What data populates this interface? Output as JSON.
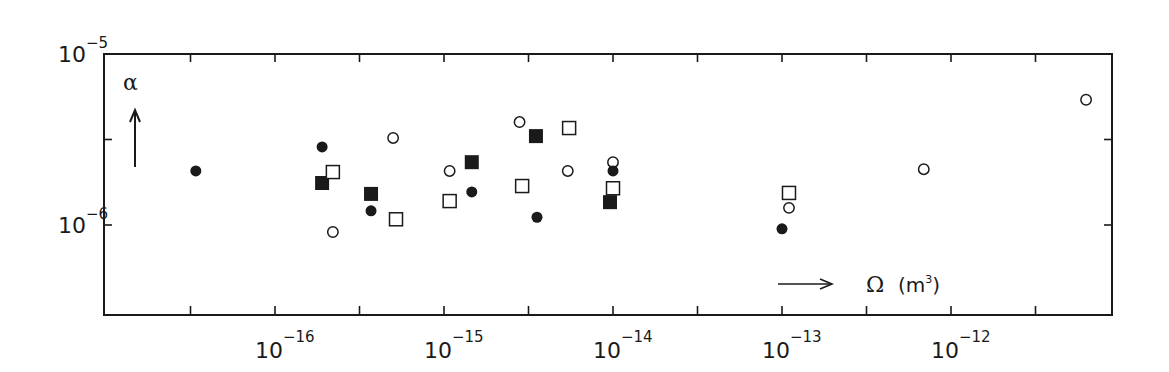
{
  "chart_data": {
    "type": "scatter",
    "title": "",
    "xlabel": "Ω (m³)",
    "ylabel": "α",
    "xscale": "log",
    "yscale": "log",
    "xlim": [
      1e-17,
      3.16e-11
    ],
    "ylim": [
      2.95e-07,
      1e-05
    ],
    "x_ticks": [
      {
        "exp": "-16",
        "value": 1e-16
      },
      {
        "exp": "-15",
        "value": 1e-15
      },
      {
        "exp": "-14",
        "value": 1e-14
      },
      {
        "exp": "-13",
        "value": 1e-13
      },
      {
        "exp": "-12",
        "value": 1e-12
      }
    ],
    "y_ticks": [
      {
        "exp": "-5",
        "value": 1e-05
      },
      {
        "exp": "-6",
        "value": 1e-06
      }
    ],
    "grid": false,
    "legend": null,
    "series": [
      {
        "name": "filled circles",
        "marker": "filled-circle",
        "points": [
          {
            "x": 3.4e-17,
            "y": 2.07e-06
          },
          {
            "x": 1.9e-16,
            "y": 2.86e-06
          },
          {
            "x": 3.7e-16,
            "y": 1.21e-06
          },
          {
            "x": 1.46e-15,
            "y": 1.56e-06
          },
          {
            "x": 3.55e-15,
            "y": 1.11e-06
          },
          {
            "x": 1e-14,
            "y": 2.07e-06
          },
          {
            "x": 1e-13,
            "y": 9.5e-07
          }
        ]
      },
      {
        "name": "open circles",
        "marker": "open-circle",
        "points": [
          {
            "x": 2.2e-16,
            "y": 9.1e-07
          },
          {
            "x": 5e-16,
            "y": 3.23e-06
          },
          {
            "x": 1.08e-15,
            "y": 2.07e-06
          },
          {
            "x": 2.8e-15,
            "y": 4e-06
          },
          {
            "x": 5.4e-15,
            "y": 2.07e-06
          },
          {
            "x": 1e-14,
            "y": 2.33e-06
          },
          {
            "x": 1.1e-13,
            "y": 1.26e-06
          },
          {
            "x": 6.9e-13,
            "y": 2.12e-06
          },
          {
            "x": 6.3e-12,
            "y": 5.4e-06
          }
        ]
      },
      {
        "name": "filled squares",
        "marker": "filled-square",
        "points": [
          {
            "x": 1.9e-16,
            "y": 1.76e-06
          },
          {
            "x": 3.7e-16,
            "y": 1.52e-06
          },
          {
            "x": 1.46e-15,
            "y": 2.33e-06
          },
          {
            "x": 3.5e-15,
            "y": 3.31e-06
          },
          {
            "x": 9.6e-15,
            "y": 1.36e-06
          }
        ]
      },
      {
        "name": "open squares",
        "marker": "open-square",
        "points": [
          {
            "x": 2.2e-16,
            "y": 2.04e-06
          },
          {
            "x": 5.2e-16,
            "y": 1.08e-06
          },
          {
            "x": 1.08e-15,
            "y": 1.38e-06
          },
          {
            "x": 2.9e-15,
            "y": 1.69e-06
          },
          {
            "x": 5.5e-15,
            "y": 3.69e-06
          },
          {
            "x": 1e-14,
            "y": 1.64e-06
          },
          {
            "x": 1.1e-13,
            "y": 1.54e-06
          }
        ]
      }
    ],
    "annotations": [
      {
        "text": "α",
        "arrow": "up",
        "position": "upper-left"
      },
      {
        "text": "Ω (m³)",
        "arrow": "right",
        "position": "lower-right"
      }
    ]
  },
  "labels": {
    "y_symbol": "α",
    "x_symbol": "Ω",
    "x_unit_open": "(m",
    "x_unit_sup": "3",
    "x_unit_close": ")",
    "tick_base": "10"
  },
  "style": {
    "ink": "#1a1a1a",
    "background": "#ffffff"
  }
}
